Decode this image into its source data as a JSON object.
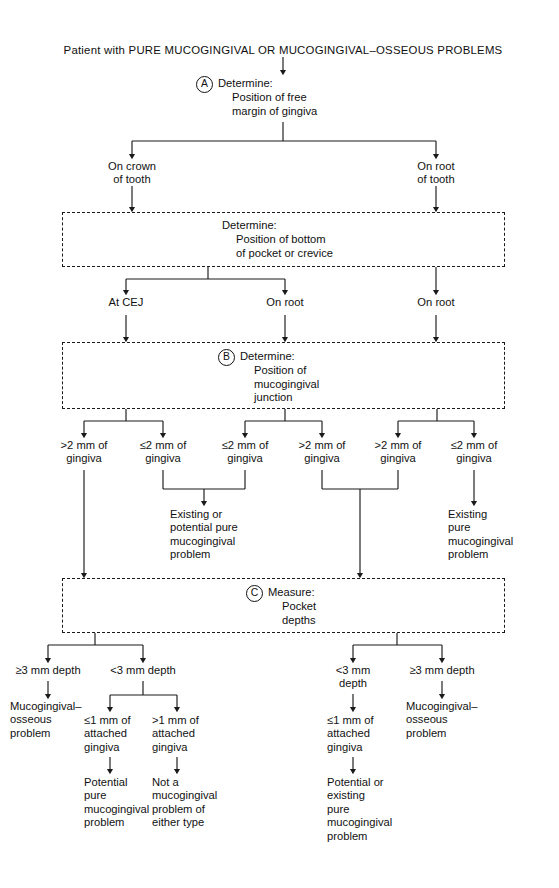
{
  "figure": {
    "title": "Patient with PURE MUCOGINGIVAL OR MUCOGINGIVAL–OSSEOUS PROBLEMS",
    "line_color": "#1a1a1a",
    "background": "#ffffff"
  },
  "steps": {
    "a": {
      "marker": "A",
      "label": "Determine:",
      "detail": "Position of free\nmargin of gingiva"
    },
    "b": {
      "marker": "B",
      "label": "Determine:",
      "detail": "Position of\nmucogingival\njunction"
    },
    "c": {
      "marker": "C",
      "label": "Measure:",
      "detail": "Pocket\ndepths"
    },
    "pocket_box": {
      "marker": "",
      "label": "Determine:",
      "detail": "Position of bottom\nof pocket or crevice"
    }
  },
  "nodes": {
    "on_crown_of_tooth": "On crown\nof tooth",
    "on_root_of_tooth": "On root\nof tooth",
    "at_cej": "At CEJ",
    "on_root_mid": "On root",
    "on_root_right": "On root",
    "g1": ">2 mm of\ngingiva",
    "g2": "≤2 mm of\ngingiva",
    "g3": "≤2 mm of\ngingiva",
    "g4": ">2 mm of\ngingiva",
    "g5": ">2 mm of\ngingiva",
    "g6": "≤2 mm of\ngingiva",
    "existing_or_potential_pure": "Existing or\npotential pure\nmucogingival\nproblem",
    "existing_pure": "Existing\npure\nmucogingival\nproblem",
    "depth_ge3_left": "≥3 mm depth",
    "depth_lt3_left": "<3 mm depth",
    "depth_lt3_right": "<3 mm\ndepth",
    "depth_ge3_right": "≥3 mm depth",
    "mg_osseous_left": "Mucogingival–\nosseous\nproblem",
    "mg_osseous_right": "Mucogingival–\nosseous\nproblem",
    "attached_le1_a": "≤1 mm of\nattached\ngingiva",
    "attached_gt1": ">1 mm of\nattached\ngingiva",
    "attached_le1_b": "≤1 mm of\nattached\ngingiva",
    "potential_pure": "Potential\npure\nmucogingival\nproblem",
    "not_a_problem": "Not a\nmucogingival\nproblem of\neither type",
    "potential_or_existing": "Potential or\nexisting\npure\nmucogingival\nproblem"
  }
}
